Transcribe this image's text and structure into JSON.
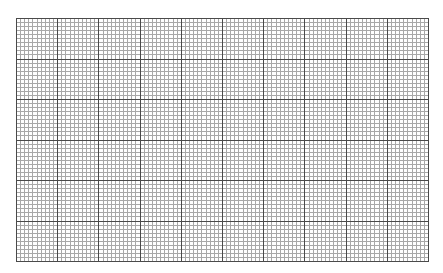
{
  "grid": {
    "major_columns": 10,
    "major_rows": 6,
    "minor_per_major": 10,
    "width": 413,
    "height": 244,
    "colors": {
      "background": "#ffffff",
      "major_line": "#4a4a4a",
      "minor_line": "#a8a8a8"
    }
  },
  "header": {
    "text": ""
  }
}
